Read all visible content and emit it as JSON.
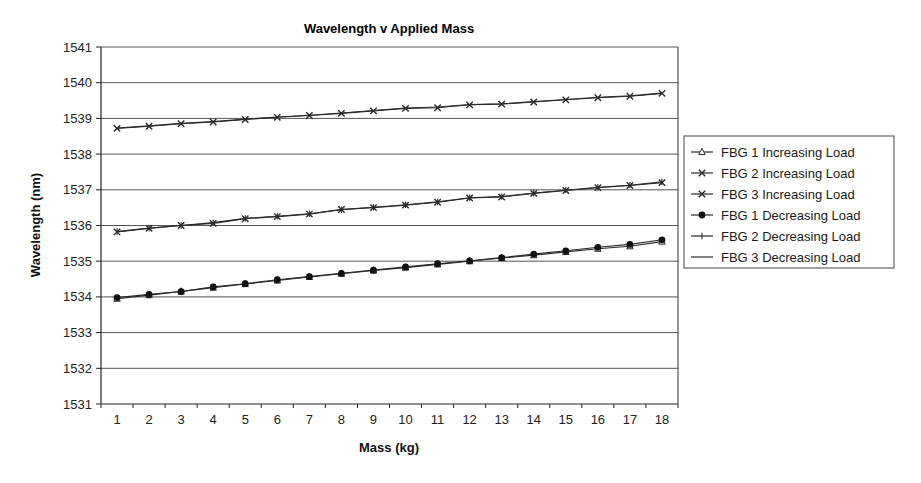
{
  "chart_data": {
    "type": "line",
    "title": "Wavelength v Applied Mass",
    "xlabel": "Mass (kg)",
    "ylabel": "Wavelength (nm)",
    "ylim": [
      1531,
      1541
    ],
    "yticks": [
      1531,
      1532,
      1533,
      1534,
      1535,
      1536,
      1537,
      1538,
      1539,
      1540,
      1541
    ],
    "grid": true,
    "legend_position": "right",
    "categories": [
      "1",
      "2",
      "3",
      "4",
      "5",
      "6",
      "7",
      "8",
      "9",
      "10",
      "11",
      "12",
      "13",
      "14",
      "15",
      "16",
      "17",
      "18"
    ],
    "series": [
      {
        "name": "FBG 1 Increasing Load",
        "marker": "triangle-open",
        "values": [
          1533.95,
          1534.05,
          1534.15,
          1534.26,
          1534.36,
          1534.46,
          1534.56,
          1534.65,
          1534.74,
          1534.82,
          1534.91,
          1535.0,
          1535.09,
          1535.17,
          1535.26,
          1535.35,
          1535.42,
          1535.55
        ]
      },
      {
        "name": "FBG 2 Increasing Load",
        "marker": "x",
        "values": [
          1535.82,
          1535.92,
          1536.0,
          1536.06,
          1536.19,
          1536.25,
          1536.32,
          1536.45,
          1536.5,
          1536.57,
          1536.65,
          1536.77,
          1536.8,
          1536.9,
          1536.98,
          1537.06,
          1537.12,
          1537.2
        ]
      },
      {
        "name": "FBG 3 Increasing Load",
        "marker": "x",
        "values": [
          1538.72,
          1538.78,
          1538.85,
          1538.9,
          1538.97,
          1539.03,
          1539.08,
          1539.14,
          1539.21,
          1539.28,
          1539.3,
          1539.38,
          1539.4,
          1539.46,
          1539.52,
          1539.58,
          1539.62,
          1539.7
        ]
      },
      {
        "name": "FBG 1 Decreasing Load",
        "marker": "circle-filled",
        "values": [
          1533.98,
          1534.07,
          1534.15,
          1534.28,
          1534.37,
          1534.48,
          1534.57,
          1534.66,
          1534.75,
          1534.84,
          1534.93,
          1535.01,
          1535.1,
          1535.2,
          1535.29,
          1535.39,
          1535.47,
          1535.6
        ]
      },
      {
        "name": "FBG 2 Decreasing Load",
        "marker": "plus",
        "values": [
          1535.83,
          1535.93,
          1536.0,
          1536.08,
          1536.2,
          1536.26,
          1536.33,
          1536.44,
          1536.51,
          1536.58,
          1536.66,
          1536.78,
          1536.81,
          1536.91,
          1536.99,
          1537.07,
          1537.13,
          1537.22
        ]
      },
      {
        "name": "FBG 3 Decreasing Load",
        "marker": "dash",
        "values": [
          1538.73,
          1538.79,
          1538.86,
          1538.91,
          1538.98,
          1539.04,
          1539.09,
          1539.15,
          1539.22,
          1539.29,
          1539.32,
          1539.39,
          1539.41,
          1539.47,
          1539.53,
          1539.59,
          1539.63,
          1539.71
        ]
      }
    ]
  },
  "colors": {
    "line": "#2a2a2a",
    "grid": "#555555",
    "marker_fill": "#111111",
    "background": "#ffffff"
  }
}
